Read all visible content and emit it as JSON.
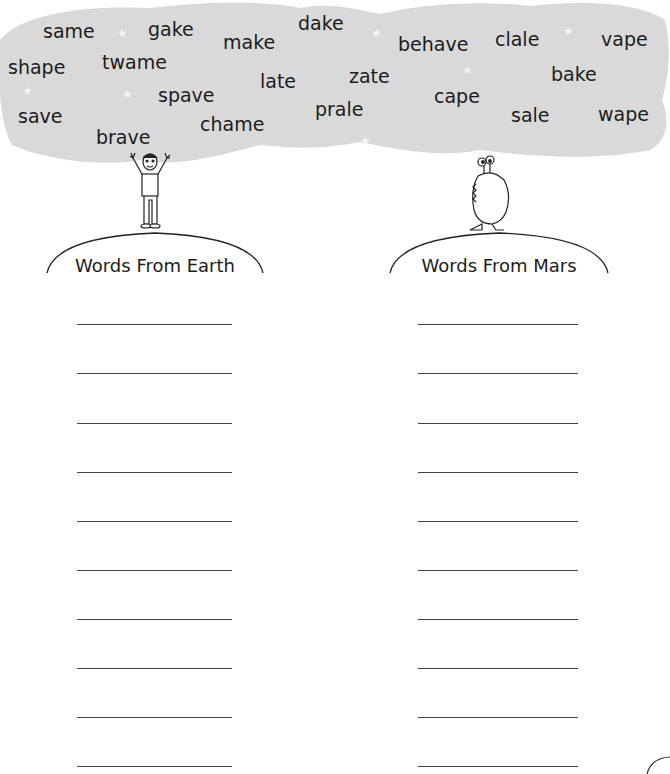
{
  "cloud": {
    "fill": "#d9d9d9",
    "words": [
      {
        "text": "same",
        "x": 43,
        "y": 22
      },
      {
        "text": "gake",
        "x": 148,
        "y": 20
      },
      {
        "text": "make",
        "x": 223,
        "y": 33
      },
      {
        "text": "dake",
        "x": 298,
        "y": 14
      },
      {
        "text": "behave",
        "x": 398,
        "y": 35
      },
      {
        "text": "clale",
        "x": 495,
        "y": 30
      },
      {
        "text": "vape",
        "x": 601,
        "y": 30
      },
      {
        "text": "shape",
        "x": 8,
        "y": 58
      },
      {
        "text": "twame",
        "x": 102,
        "y": 53
      },
      {
        "text": "late",
        "x": 260,
        "y": 72
      },
      {
        "text": "zate",
        "x": 349,
        "y": 67
      },
      {
        "text": "bake",
        "x": 551,
        "y": 65
      },
      {
        "text": "spave",
        "x": 158,
        "y": 86
      },
      {
        "text": "cape",
        "x": 434,
        "y": 87
      },
      {
        "text": "save",
        "x": 18,
        "y": 107
      },
      {
        "text": "prale",
        "x": 315,
        "y": 100
      },
      {
        "text": "sale",
        "x": 511,
        "y": 106
      },
      {
        "text": "wape",
        "x": 598,
        "y": 105
      },
      {
        "text": "chame",
        "x": 200,
        "y": 115
      },
      {
        "text": "brave",
        "x": 96,
        "y": 128
      }
    ],
    "stars": [
      {
        "x": 117,
        "y": 27
      },
      {
        "x": 22,
        "y": 85
      },
      {
        "x": 122,
        "y": 88
      },
      {
        "x": 371,
        "y": 27
      },
      {
        "x": 462,
        "y": 64
      },
      {
        "x": 563,
        "y": 25
      },
      {
        "x": 360,
        "y": 135
      }
    ]
  },
  "columns": [
    {
      "id": "earth",
      "heading": "Words From Earth",
      "character": "boy waving arms",
      "blank_lines": 10
    },
    {
      "id": "mars",
      "heading": "Words From Mars",
      "character": "alien with eye stalks",
      "blank_lines": 10
    }
  ],
  "line_positions_y": [
    324,
    373,
    423,
    472,
    521,
    570,
    619,
    668,
    717,
    766
  ]
}
